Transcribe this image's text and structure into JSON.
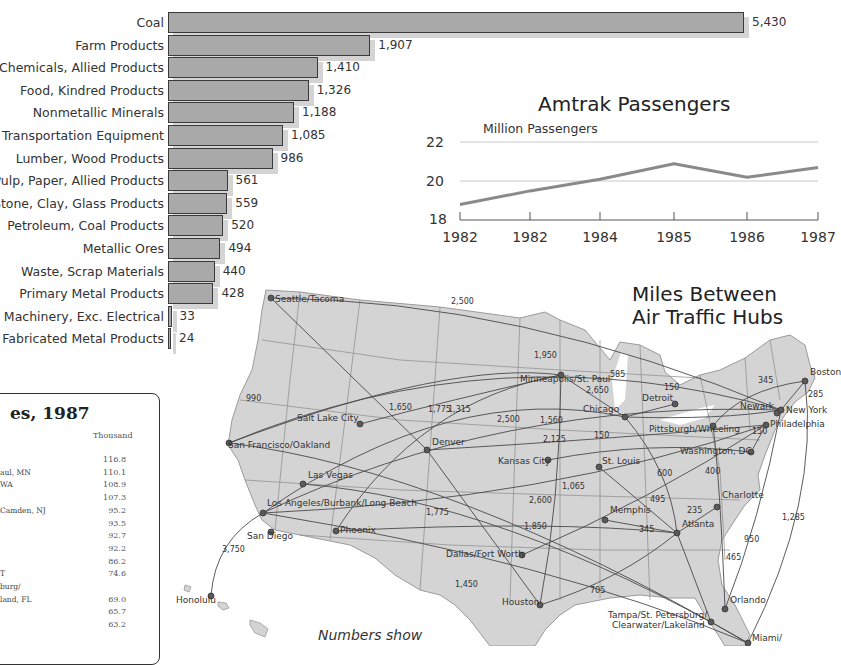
{
  "chart_data": [
    {
      "type": "bar",
      "orientation": "horizontal",
      "title": "",
      "categories": [
        "Coal",
        "Farm Products",
        "Chemicals, Allied Products",
        "Food, Kindred Products",
        "Nonmetallic Minerals",
        "Transportation Equipment",
        "Lumber, Wood Products",
        "Pulp, Paper, Allied Products",
        "Stone, Clay, Glass Products",
        "Petroleum, Coal Products",
        "Metallic Ores",
        "Waste, Scrap Materials",
        "Primary Metal Products",
        "Machinery, Exc. Electrical",
        "Fabricated Metal Products"
      ],
      "values": [
        5430,
        1907,
        1410,
        1326,
        1188,
        1085,
        986,
        561,
        559,
        520,
        494,
        440,
        428,
        33,
        24
      ],
      "value_labels": [
        "5,430",
        "1,907",
        "1,410",
        "1,326",
        "1,188",
        "1,085",
        "986",
        "561",
        "559",
        "520",
        "494",
        "440",
        "428",
        "33",
        "24"
      ],
      "xlabel": "",
      "ylabel": "",
      "grid": false
    },
    {
      "type": "line",
      "title": "Amtrak Passengers",
      "ylabel": "Million Passengers",
      "x": [
        "1982",
        "1982",
        "1984",
        "1985",
        "1986",
        "1987"
      ],
      "series": [
        {
          "name": "Amtrak Passengers",
          "values": [
            18.8,
            19.5,
            20.1,
            20.9,
            20.2,
            20.7
          ]
        }
      ],
      "yticks": [
        "22",
        "20",
        "18"
      ],
      "ylim": [
        18,
        22
      ],
      "grid": true
    },
    {
      "type": "table",
      "title": "es, 1987",
      "column_header": "Thousand",
      "rows": [
        {
          "label": "",
          "value": "116.8"
        },
        {
          "label": "aul, MN",
          "value": "110.1"
        },
        {
          "label": "WA",
          "value": "108.9"
        },
        {
          "label": "",
          "value": "107.3"
        },
        {
          "label": "Camden, NJ",
          "value": "95.2"
        },
        {
          "label": "",
          "value": "93.5"
        },
        {
          "label": "",
          "value": "92.7"
        },
        {
          "label": "",
          "value": "92.2"
        },
        {
          "label": "",
          "value": "86.2"
        },
        {
          "label": "T",
          "value": "74.6"
        },
        {
          "label": "burg/",
          "value": ""
        },
        {
          "label": "land, FL",
          "value": "69.0"
        },
        {
          "label": "",
          "value": "65.7"
        },
        {
          "label": "",
          "value": "63.2"
        }
      ]
    }
  ],
  "map": {
    "title_line1": "Miles Between",
    "title_line2": "Air Traffic Hubs",
    "note": "Numbers show",
    "cities": [
      {
        "name": "Seattle/Tacoma",
        "x": 271,
        "y": 298,
        "lx": 275,
        "ly": 300
      },
      {
        "name": "Salt Lake City",
        "x": 360,
        "y": 424,
        "lx": 297,
        "ly": 419
      },
      {
        "name": "San Francisco/Oakland",
        "x": 229,
        "y": 443,
        "lx": 228,
        "ly": 446
      },
      {
        "name": "Denver",
        "x": 427,
        "y": 450,
        "lx": 432,
        "ly": 443
      },
      {
        "name": "Las Vegas",
        "x": 303,
        "y": 484,
        "lx": 308,
        "ly": 476
      },
      {
        "name": "Los Angeles/Burbank/Long Beach",
        "x": 263,
        "y": 513,
        "lx": 267,
        "ly": 504
      },
      {
        "name": "San Diego",
        "x": 271,
        "y": 532,
        "lx": 247,
        "ly": 537
      },
      {
        "name": "Phoenix",
        "x": 336,
        "y": 531,
        "lx": 340,
        "ly": 531
      },
      {
        "name": "Honolulu",
        "x": 211,
        "y": 596,
        "lx": 176,
        "ly": 601
      },
      {
        "name": "Minneapolis/St. Paul",
        "x": 561,
        "y": 375,
        "lx": 520,
        "ly": 380
      },
      {
        "name": "Chicago",
        "x": 625,
        "y": 417,
        "lx": 583,
        "ly": 410
      },
      {
        "name": "Detroit",
        "x": 675,
        "y": 404,
        "lx": 642,
        "ly": 399
      },
      {
        "name": "Kansas City",
        "x": 548,
        "y": 460,
        "lx": 498,
        "ly": 462
      },
      {
        "name": "St. Louis",
        "x": 599,
        "y": 467,
        "lx": 602,
        "ly": 462
      },
      {
        "name": "Dallas/Fort Worth",
        "x": 522,
        "y": 555,
        "lx": 446,
        "ly": 555
      },
      {
        "name": "Houston",
        "x": 540,
        "y": 605,
        "lx": 502,
        "ly": 603
      },
      {
        "name": "Memphis",
        "x": 605,
        "y": 520,
        "lx": 610,
        "ly": 511
      },
      {
        "name": "Atlanta",
        "x": 677,
        "y": 533,
        "lx": 682,
        "ly": 525
      },
      {
        "name": "Charlotte",
        "x": 717,
        "y": 507,
        "lx": 722,
        "ly": 496
      },
      {
        "name": "Pittsburgh/Wheeling",
        "x": 713,
        "y": 426,
        "lx": 649,
        "ly": 430
      },
      {
        "name": "Washington, DC",
        "x": 751,
        "y": 452,
        "lx": 680,
        "ly": 452
      },
      {
        "name": "Philadelphia",
        "x": 766,
        "y": 425,
        "lx": 770,
        "ly": 425
      },
      {
        "name": "Newark",
        "x": 777,
        "y": 413,
        "lx": 740,
        "ly": 407
      },
      {
        "name": "New York",
        "x": 781,
        "y": 410,
        "lx": 786,
        "ly": 411
      },
      {
        "name": "Boston",
        "x": 805,
        "y": 381,
        "lx": 810,
        "ly": 373
      },
      {
        "name": "Orlando",
        "x": 725,
        "y": 609,
        "lx": 730,
        "ly": 601
      },
      {
        "name": "Tampa/St. Petersburg/",
        "x": 711,
        "y": 622,
        "lx": 608,
        "ly": 616
      },
      {
        "name": "Clearwater/Lakeland",
        "x": 0,
        "y": 0,
        "lx": 612,
        "ly": 626
      },
      {
        "name": "Miami/",
        "x": 748,
        "y": 643,
        "lx": 752,
        "ly": 639
      }
    ],
    "distances": [
      {
        "text": "2,500",
        "x": 451,
        "y": 302
      },
      {
        "text": "1,950",
        "x": 534,
        "y": 356
      },
      {
        "text": "585",
        "x": 610,
        "y": 375
      },
      {
        "text": "2,650",
        "x": 586,
        "y": 391
      },
      {
        "text": "150",
        "x": 664,
        "y": 388
      },
      {
        "text": "345",
        "x": 758,
        "y": 381
      },
      {
        "text": "285",
        "x": 808,
        "y": 395
      },
      {
        "text": "1,650",
        "x": 389,
        "y": 408
      },
      {
        "text": "1,775",
        "x": 428,
        "y": 410
      },
      {
        "text": "1,315",
        "x": 448,
        "y": 410
      },
      {
        "text": "2,500",
        "x": 497,
        "y": 420
      },
      {
        "text": "1,560",
        "x": 540,
        "y": 421
      },
      {
        "text": "2,125",
        "x": 543,
        "y": 440
      },
      {
        "text": "150",
        "x": 594,
        "y": 436
      },
      {
        "text": "990",
        "x": 246,
        "y": 399
      },
      {
        "text": "150",
        "x": 752,
        "y": 432
      },
      {
        "text": "600",
        "x": 657,
        "y": 474
      },
      {
        "text": "400",
        "x": 705,
        "y": 472
      },
      {
        "text": "1,065",
        "x": 562,
        "y": 487
      },
      {
        "text": "495",
        "x": 650,
        "y": 500
      },
      {
        "text": "2,600",
        "x": 529,
        "y": 501
      },
      {
        "text": "1,775",
        "x": 426,
        "y": 513
      },
      {
        "text": "235",
        "x": 687,
        "y": 511
      },
      {
        "text": "1,850",
        "x": 524,
        "y": 527
      },
      {
        "text": "345",
        "x": 639,
        "y": 530
      },
      {
        "text": "1,285",
        "x": 782,
        "y": 518
      },
      {
        "text": "3,750",
        "x": 222,
        "y": 550
      },
      {
        "text": "950",
        "x": 744,
        "y": 540
      },
      {
        "text": "465",
        "x": 726,
        "y": 558
      },
      {
        "text": "1,450",
        "x": 455,
        "y": 585
      },
      {
        "text": "705",
        "x": 590,
        "y": 591
      }
    ]
  },
  "colors": {
    "bar_fill": "#a9a9a9",
    "bar_border": "#3a3a3a",
    "bar_shadow": "#d4d4d4",
    "map_land": "#d3d3d3",
    "map_lines": "#6a6a6a",
    "line_series": "#8a8a8a",
    "hub_dot": "#5a5a5a"
  }
}
